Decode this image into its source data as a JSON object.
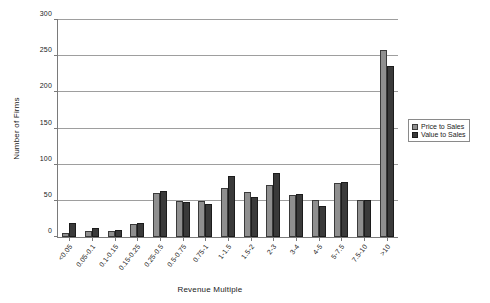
{
  "chart_data": {
    "type": "bar",
    "title": "",
    "xlabel": "Revenue Multiple",
    "ylabel": "Number of Firms",
    "ylim": [
      0,
      300
    ],
    "yticks": [
      0,
      50,
      100,
      150,
      200,
      250,
      300
    ],
    "ytick_labels": [
      "0",
      "50",
      "100",
      "150",
      "200",
      "250",
      "300"
    ],
    "grid": true,
    "legend_position": "right",
    "categories": [
      "<0.05",
      "0.05-0.1",
      "0.1-0.15",
      "0.15-0.25",
      "0.25-0.5",
      "0.5-0.75",
      "0.75-1",
      "1-1.5",
      "1.5-2",
      "2-3",
      "3-4",
      "4-5",
      "5-7.5",
      "7.5-10",
      ">10"
    ],
    "series": [
      {
        "name": "Price to Sales",
        "color": "#8f8f8f",
        "values": [
          5,
          8,
          9,
          18,
          61,
          50,
          50,
          68,
          62,
          72,
          58,
          51,
          74,
          51,
          258
        ]
      },
      {
        "name": "Value to Sales",
        "color": "#3a3a3a",
        "values": [
          20,
          13,
          10,
          20,
          64,
          48,
          45,
          85,
          56,
          89,
          60,
          43,
          76,
          51,
          237
        ]
      }
    ]
  }
}
